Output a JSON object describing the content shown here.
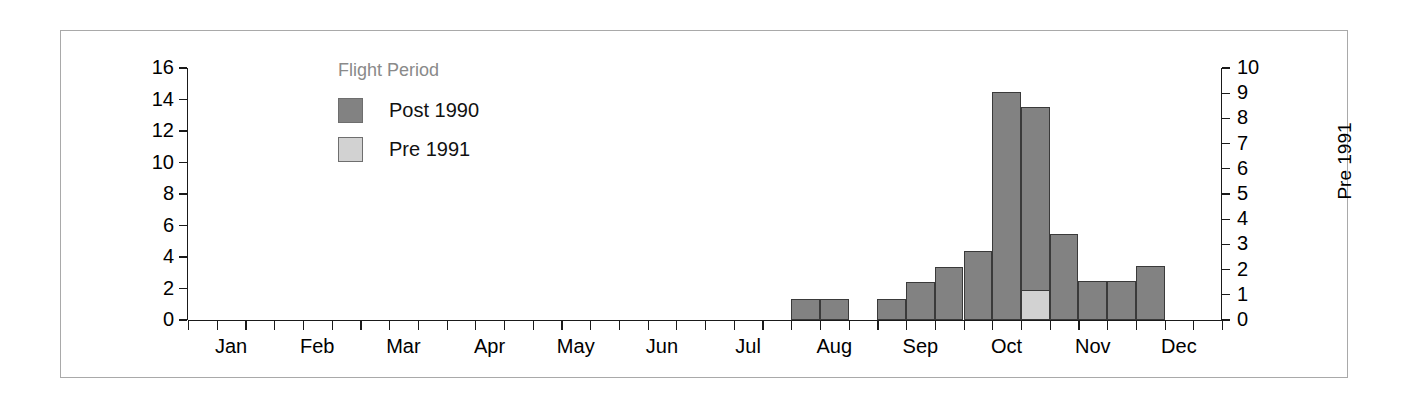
{
  "chart_data": {
    "type": "bar",
    "title": "",
    "subtitle": "",
    "xlabel": "",
    "ylabel": "Post 1990",
    "y2label": "Pre 1991",
    "ylim": [
      0,
      16
    ],
    "y2lim": [
      0,
      10
    ],
    "grid": false,
    "legend_position": "upper-left-inside",
    "x_tick_labels": [
      "Jan",
      "Feb",
      "Mar",
      "Apr",
      "May",
      "Jun",
      "Jul",
      "Aug",
      "Sep",
      "Oct",
      "Nov",
      "Dec"
    ],
    "x_axis_note": "Minor tick marks divide each month into thirds (week-like bins); 36 bins total across the year.",
    "y_tick_labels": [
      "0",
      "2",
      "4",
      "6",
      "8",
      "10",
      "12",
      "14",
      "16"
    ],
    "y2_tick_labels": [
      "0",
      "1",
      "2",
      "3",
      "4",
      "5",
      "6",
      "7",
      "8",
      "9",
      "10"
    ],
    "series": [
      {
        "name": "Post 1990",
        "axis": "left",
        "color": "#828282",
        "values": [
          {
            "bin": 21,
            "month": "Jun",
            "value": 1.35
          },
          {
            "bin": 22,
            "month": "Jun",
            "value": 1.35
          },
          {
            "bin": 24,
            "month": "Jul",
            "value": 1.35
          },
          {
            "bin": 25,
            "month": "Jul",
            "value": 2.4
          },
          {
            "bin": 26,
            "month": "Jul",
            "value": 3.35
          },
          {
            "bin": 27,
            "month": "Jul",
            "value": 4.4
          },
          {
            "bin": 28,
            "month": "Jul",
            "value": 14.5
          },
          {
            "bin": 29,
            "month": "Aug",
            "value": 13.5
          },
          {
            "bin": 30,
            "month": "Aug",
            "value": 5.45
          },
          {
            "bin": 31,
            "month": "Aug",
            "value": 2.45
          },
          {
            "bin": 32,
            "month": "Aug",
            "value": 2.45
          },
          {
            "bin": 33,
            "month": "Aug",
            "value": 3.45
          }
        ]
      },
      {
        "name": "Pre 1991",
        "axis": "right",
        "color": "#d2d2d2",
        "values": [
          {
            "bin": 29,
            "month": "Aug",
            "value": 1.2
          }
        ]
      }
    ]
  },
  "legend": {
    "title": "Flight Period",
    "entries": [
      {
        "label": "Post 1990",
        "color": "#828282"
      },
      {
        "label": "Pre 1991",
        "color": "#d2d2d2"
      }
    ]
  },
  "axes": {
    "left_title": "Post 1990",
    "right_title": "Pre 1991"
  }
}
